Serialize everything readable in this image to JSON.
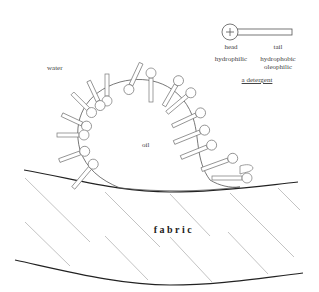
{
  "diagram": {
    "labels": {
      "water": "water",
      "oil": "oil",
      "fabric": "fabric"
    },
    "legend": {
      "head_label": "head",
      "tail_label": "tail",
      "head_property": "hydrophilic",
      "tail_property_line1": "hydrophobic",
      "tail_property_line2": "oleophilic",
      "caption": "a detergent",
      "head_symbol": "+"
    },
    "colors": {
      "stroke": "#555555",
      "fabric_edge": "#222222",
      "hatch": "#999999"
    }
  }
}
